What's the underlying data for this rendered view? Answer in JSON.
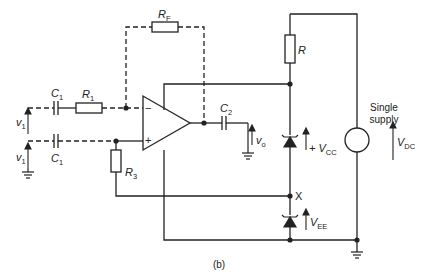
{
  "figure": {
    "caption": "(b)",
    "components": {
      "RF": {
        "sym": "R",
        "sub": "F"
      },
      "R1": {
        "sym": "R",
        "sub": "1"
      },
      "C1_top": {
        "sym": "C",
        "sub": "1"
      },
      "C1_bot": {
        "sym": "C",
        "sub": "1"
      },
      "C2": {
        "sym": "C",
        "sub": "2"
      },
      "R3": {
        "sym": "R",
        "sub": "3"
      },
      "R": {
        "sym": "R"
      },
      "vin_top": {
        "sym": "v",
        "sub": "1"
      },
      "vin_bot": {
        "sym": "v",
        "sub": "1"
      },
      "vout": {
        "sym": "v",
        "sub": "o"
      },
      "vcc": {
        "prefix": "+ V",
        "sub": "CC"
      },
      "vee": {
        "sym": "V",
        "sub": "EE"
      },
      "vdc": {
        "sym": "V",
        "sub": "DC"
      },
      "node_x": "X",
      "opamp_minus": "−",
      "opamp_plus": "+"
    },
    "supply_label": [
      "Single",
      "supply"
    ]
  }
}
